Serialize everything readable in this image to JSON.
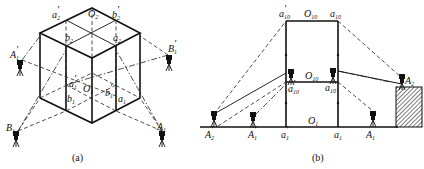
{
  "figure_a": {
    "caption": "(a)",
    "labels": {
      "a2p": {
        "base": "a",
        "sub": "2",
        "prime": "′"
      },
      "O2": {
        "base": "O",
        "sub": "2",
        "prime": ""
      },
      "b2p": {
        "base": "b",
        "sub": "2",
        "prime": "′"
      },
      "b2": {
        "base": "b",
        "sub": "2",
        "prime": ""
      },
      "a2": {
        "base": "a",
        "sub": "2",
        "prime": ""
      },
      "A1p": {
        "base": "A",
        "sub": "1",
        "prime": "′"
      },
      "B1p": {
        "base": "B",
        "sub": "1",
        "prime": "′"
      },
      "a1p": {
        "base": "a",
        "sub": "1",
        "prime": "′"
      },
      "O1": {
        "base": "O",
        "sub": "1",
        "prime": ""
      },
      "b1p": {
        "base": "b",
        "sub": "1",
        "prime": "′"
      },
      "b1": {
        "base": "b",
        "sub": "1",
        "prime": ""
      },
      "a1": {
        "base": "a",
        "sub": "1",
        "prime": ""
      },
      "B1": {
        "base": "B",
        "sub": "1",
        "prime": ""
      },
      "A1": {
        "base": "A",
        "sub": "1",
        "prime": ""
      }
    }
  },
  "figure_b": {
    "caption": "(b)",
    "labels": {
      "a10p_top": {
        "base": "a",
        "sub": "10",
        "prime": "′"
      },
      "O10_top": {
        "base": "O",
        "sub": "10",
        "prime": ""
      },
      "a10_top": {
        "base": "a",
        "sub": "10",
        "prime": ""
      },
      "O10_mid": {
        "base": "O",
        "sub": "10",
        "prime": ""
      },
      "a10p_mid": {
        "base": "a",
        "sub": "10",
        "prime": "′"
      },
      "a10_mid": {
        "base": "a",
        "sub": "10",
        "prime": ""
      },
      "A2": {
        "base": "A",
        "sub": "2",
        "prime": ""
      },
      "O1": {
        "base": "O",
        "sub": "1",
        "prime": ""
      },
      "A2p": {
        "base": "A",
        "sub": "2",
        "prime": "′"
      },
      "A1p": {
        "base": "A",
        "sub": "1",
        "prime": "′"
      },
      "a1p": {
        "base": "a",
        "sub": "1",
        "prime": "′"
      },
      "a1": {
        "base": "a",
        "sub": "1",
        "prime": ""
      },
      "A1": {
        "base": "A",
        "sub": "1",
        "prime": ""
      }
    }
  }
}
